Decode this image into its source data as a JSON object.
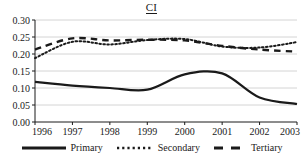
{
  "chart_data": {
    "type": "line",
    "title": "CI",
    "xlabel": "",
    "ylabel": "",
    "x": [
      1996,
      1997,
      1998,
      1999,
      2000,
      2001,
      2002,
      2003
    ],
    "xlim": [
      1996,
      2003
    ],
    "ylim": [
      0.0,
      0.3
    ],
    "yticks": [
      0.0,
      0.05,
      0.1,
      0.15,
      0.2,
      0.25,
      0.3
    ],
    "ytick_labels": [
      "0.00",
      "0.05",
      "0.10",
      "0.15",
      "0.20",
      "0.25",
      "0.30"
    ],
    "xtick_labels": [
      "1996",
      "1997",
      "1998",
      "1999",
      "2000",
      "2001",
      "2002",
      "2003"
    ],
    "grid": "horizontal",
    "legend_position": "bottom",
    "series": [
      {
        "name": "Primary",
        "style": "solid",
        "color": "#1a1a1a",
        "values": [
          0.118,
          0.107,
          0.1,
          0.095,
          0.14,
          0.143,
          0.072,
          0.053
        ]
      },
      {
        "name": "Secondary",
        "style": "dotted",
        "color": "#1a1a1a",
        "values": [
          0.188,
          0.236,
          0.228,
          0.241,
          0.244,
          0.222,
          0.219,
          0.235
        ]
      },
      {
        "name": "Tertiary",
        "style": "dashed",
        "color": "#1a1a1a",
        "values": [
          0.213,
          0.246,
          0.24,
          0.242,
          0.24,
          0.224,
          0.213,
          0.207
        ]
      }
    ]
  },
  "legend": {
    "items": [
      {
        "label": "Primary",
        "style": "solid"
      },
      {
        "label": "Secondary",
        "style": "dotted"
      },
      {
        "label": "Tertiary",
        "style": "dashed"
      }
    ]
  }
}
